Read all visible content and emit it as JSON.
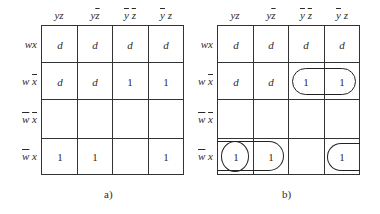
{
  "diagram": {
    "type": "karnaugh-map",
    "column_headers": [
      "yz",
      "yz̄",
      "ȳz̄",
      "ȳz"
    ],
    "row_headers": [
      "wx",
      "wx̄",
      "w̄x̄",
      "w̄x"
    ],
    "maps": [
      {
        "caption": "a)",
        "cells": [
          [
            "d",
            "d",
            "d",
            "d"
          ],
          [
            "d",
            "d",
            "1",
            "1"
          ],
          [
            "",
            "",
            "",
            ""
          ],
          [
            "1",
            "1",
            "",
            "1"
          ]
        ],
        "groups": []
      },
      {
        "caption": "b)",
        "cells": [
          [
            "d",
            "d",
            "d",
            "d"
          ],
          [
            "d",
            "d",
            "1",
            "1"
          ],
          [
            "",
            "",
            "",
            ""
          ],
          [
            "1",
            "1",
            "",
            "1"
          ]
        ],
        "groups": [
          {
            "name": "group-wxbar-ybar",
            "row": 1,
            "cols": [
              2,
              3
            ],
            "shape": "rounded-rect"
          },
          {
            "name": "group-wbarx-yz",
            "row": 3,
            "cols": [
              0
            ],
            "shape": "circle"
          },
          {
            "name": "group-wbarx-wrap",
            "row": 3,
            "cols": [
              3,
              0,
              1
            ],
            "shape": "wraparound"
          }
        ]
      }
    ]
  },
  "labels": {
    "col0": "yz",
    "col1": "yz",
    "col2": "y z",
    "col3": "y z",
    "row0": "wx",
    "row1": "w x",
    "row2": "w x",
    "row3": "w x"
  },
  "map_a": {
    "caption": "a)",
    "r0": [
      "d",
      "d",
      "d",
      "d"
    ],
    "r1": [
      "d",
      "d",
      "1",
      "1"
    ],
    "r2": [
      "",
      "",
      "",
      ""
    ],
    "r3": [
      "1",
      "1",
      "",
      "1"
    ]
  },
  "map_b": {
    "caption": "b)",
    "r0": [
      "d",
      "d",
      "d",
      "d"
    ],
    "r1": [
      "d",
      "d",
      "1",
      "1"
    ],
    "r2": [
      "",
      "",
      "",
      ""
    ],
    "r3": [
      "1",
      "1",
      "",
      "1"
    ]
  }
}
